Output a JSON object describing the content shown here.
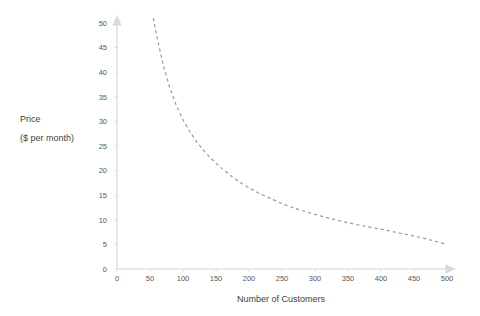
{
  "chart_data": {
    "type": "line",
    "title": "",
    "subtitle": "",
    "xlabel": "Number of Customers",
    "ylabel_line1": "Price",
    "ylabel_line2": "($ per month)",
    "xlim": [
      0,
      500
    ],
    "ylim": [
      0,
      50
    ],
    "xticks": [
      0,
      50,
      100,
      150,
      200,
      250,
      300,
      350,
      400,
      450,
      500
    ],
    "xticklabels": [
      "0",
      "50",
      "100",
      "150",
      "200",
      "250",
      "300",
      "350",
      "400",
      "450",
      "500"
    ],
    "yticks": [
      0,
      5,
      10,
      15,
      20,
      25,
      30,
      35,
      40,
      45,
      50
    ],
    "yticklabels": [
      "0",
      "5",
      "10",
      "15",
      "20",
      "25",
      "30",
      "35",
      "40",
      "45",
      "50"
    ],
    "grid": false,
    "legend": null,
    "series": [
      {
        "name": "Demand curve",
        "style": "dashed",
        "color": "#9a9a9e",
        "x": [
          55,
          60,
          70,
          80,
          90,
          100,
          110,
          120,
          130,
          140,
          150,
          160,
          175,
          190,
          200,
          215,
          230,
          250,
          270,
          290,
          300,
          325,
          350,
          375,
          400,
          425,
          450,
          475,
          500
        ],
        "values": [
          51.0,
          47.5,
          41.5,
          36.8,
          33.2,
          30.3,
          28.0,
          26.0,
          24.3,
          22.8,
          21.5,
          20.3,
          18.7,
          17.3,
          16.5,
          15.4,
          14.5,
          13.3,
          12.3,
          11.5,
          11.1,
          10.2,
          9.4,
          8.7,
          8.1,
          7.4,
          6.7,
          5.9,
          5.0
        ]
      }
    ],
    "axis_arrows": {
      "x_right": true,
      "y_top": true
    },
    "background_color": "#ffffff",
    "axis_color": "#d3d3d6",
    "text_color": "#58585a"
  }
}
